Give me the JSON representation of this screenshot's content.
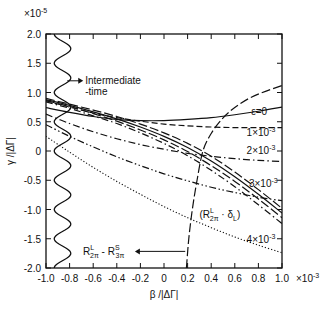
{
  "chart_data": {
    "type": "line",
    "title": "",
    "xlabel": "β /|ΔΓ|",
    "ylabel": "γ /|ΔΓ|",
    "x_multiplier": "×10",
    "x_multiplier_exp": "-3",
    "y_multiplier": "×10",
    "y_multiplier_exp": "-5",
    "xlim": [
      -1.0,
      1.0
    ],
    "ylim": [
      -2.0,
      2.0
    ],
    "x_ticks": [
      "-1.0",
      "-0.8",
      "-0.6",
      "-0.4",
      "-0.2",
      "0",
      "0.2",
      "0.4",
      "0.6",
      "0.8",
      "1.0"
    ],
    "x_tick_values": [
      -1.0,
      -0.8,
      -0.6,
      -0.4,
      -0.2,
      0,
      0.2,
      0.4,
      0.6,
      0.8,
      1.0
    ],
    "y_ticks": [
      "2.0",
      "1.5",
      "1.0",
      "0.5",
      "0",
      "-0.5",
      "-1.0",
      "-1.5",
      "-2.0"
    ],
    "y_tick_values": [
      2.0,
      1.5,
      1.0,
      0.5,
      0,
      -0.5,
      -1.0,
      -1.5,
      -2.0
    ],
    "grid": false,
    "series": [
      {
        "name": "ε=0",
        "style": "solid",
        "x": [
          -1.0,
          -0.8,
          -0.6,
          -0.4,
          -0.2,
          0,
          0.2,
          0.4,
          0.6,
          0.8,
          1.0
        ],
        "y": [
          0.74,
          0.66,
          0.59,
          0.54,
          0.52,
          0.52,
          0.54,
          0.57,
          0.62,
          0.68,
          0.75
        ]
      },
      {
        "name": "1×10⁻³",
        "style": "dashed",
        "x": [
          -1.0,
          -0.8,
          -0.6,
          -0.4,
          -0.2,
          0,
          0.2,
          0.4,
          0.6,
          0.8,
          1.0
        ],
        "y": [
          0.86,
          0.75,
          0.65,
          0.57,
          0.51,
          0.46,
          0.43,
          0.41,
          0.4,
          0.4,
          0.4
        ]
      },
      {
        "name": "2×10⁻³",
        "style": "dash-dot",
        "x": [
          -1.0,
          -0.8,
          -0.6,
          -0.4,
          -0.2,
          0,
          0.2,
          0.4,
          0.6,
          0.8,
          1.0
        ],
        "y": [
          0.63,
          0.47,
          0.33,
          0.21,
          0.11,
          0.03,
          -0.04,
          -0.09,
          -0.13,
          -0.16,
          -0.18
        ]
      },
      {
        "name": "3×10⁻³",
        "style": "dash-dot-dot",
        "x": [
          -1.0,
          -0.8,
          -0.6,
          -0.4,
          -0.2,
          0,
          0.2,
          0.4,
          0.6,
          0.8,
          1.0
        ],
        "y": [
          0.45,
          0.25,
          0.07,
          -0.1,
          -0.25,
          -0.39,
          -0.51,
          -0.62,
          -0.71,
          -0.79,
          -0.85
        ]
      },
      {
        "name": "4×10⁻³",
        "style": "dotted",
        "x": [
          -1.0,
          -0.8,
          -0.6,
          -0.4,
          -0.2,
          0,
          0.2,
          0.4,
          0.6,
          0.8,
          1.0
        ],
        "y": [
          0.25,
          -0.02,
          -0.28,
          -0.52,
          -0.74,
          -0.95,
          -1.14,
          -1.31,
          -1.47,
          -1.61,
          -1.74
        ]
      },
      {
        "name": "(R2π L · δL) band a",
        "style": "long-dash",
        "x": [
          -1.0,
          -0.8,
          -0.6,
          -0.4,
          -0.2,
          0,
          0.2,
          0.4,
          0.6,
          0.8,
          1.0
        ],
        "y": [
          0.9,
          0.8,
          0.7,
          0.59,
          0.46,
          0.31,
          0.13,
          -0.09,
          -0.36,
          -0.66,
          -0.98
        ]
      },
      {
        "name": "(R2π L · δL) band b",
        "style": "solid",
        "x": [
          -1.0,
          -0.8,
          -0.6,
          -0.4,
          -0.2,
          0,
          0.2,
          0.4,
          0.6,
          0.8,
          1.0
        ],
        "y": [
          0.88,
          0.78,
          0.67,
          0.55,
          0.41,
          0.25,
          0.06,
          -0.17,
          -0.44,
          -0.74,
          -1.06
        ]
      },
      {
        "name": "(R2π L · δL) band c",
        "style": "long-dash",
        "x": [
          -1.0,
          -0.8,
          -0.6,
          -0.4,
          -0.2,
          0,
          0.2,
          0.4,
          0.6,
          0.8,
          1.0
        ],
        "y": [
          0.86,
          0.76,
          0.64,
          0.51,
          0.36,
          0.19,
          -0.01,
          -0.25,
          -0.52,
          -0.82,
          -1.14
        ]
      },
      {
        "name": "(R2π L · δL) band d",
        "style": "dash-dot",
        "x": [
          -1.0,
          -0.8,
          -0.6,
          -0.4,
          -0.2,
          0,
          0.2,
          0.4,
          0.6,
          0.8,
          1.0
        ],
        "y": [
          0.84,
          0.73,
          0.6,
          0.47,
          0.31,
          0.13,
          -0.08,
          -0.33,
          -0.61,
          -0.92,
          -1.24
        ]
      },
      {
        "name": "R2π L - R3π S",
        "style": "long-dash",
        "x": [
          0.19,
          0.21,
          0.24,
          0.28,
          0.33,
          0.4,
          0.48,
          0.56,
          0.64,
          0.74,
          0.86,
          1.0
        ],
        "y": [
          -2.0,
          -1.5,
          -1.0,
          -0.5,
          0.0,
          0.3,
          0.52,
          0.68,
          0.8,
          0.92,
          1.02,
          1.12
        ]
      },
      {
        "name": "Intermediate-time",
        "style": "wavy",
        "x_center": -0.86,
        "amplitude": 0.07,
        "period_y": 0.5
      }
    ],
    "annotations": [
      {
        "text": "Intermediate",
        "line2": "-time",
        "arrow": "left",
        "x": -0.82,
        "y": 1.2
      },
      {
        "text": "ε=0",
        "x": 0.74,
        "y": 0.62
      },
      {
        "text": "1×10",
        "exp": "-3",
        "x": 0.7,
        "y": 0.25
      },
      {
        "text": "2×10",
        "exp": "-3",
        "x": 0.7,
        "y": -0.05
      },
      {
        "text": "3×10",
        "exp": "-3",
        "x": 0.72,
        "y": -0.62
      },
      {
        "text": "4×10",
        "exp": "-3",
        "x": 0.7,
        "y": -1.58
      },
      {
        "text": "(R2π L · δL)",
        "x": 0.3,
        "y": -1.15
      },
      {
        "text": "R2π L - R3π S",
        "arrow": "left",
        "x": -0.45,
        "y": -1.75
      }
    ],
    "legend": "none"
  }
}
